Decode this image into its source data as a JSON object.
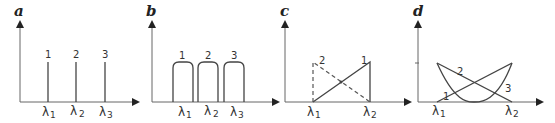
{
  "panels": [
    {
      "label": "a",
      "lines": [
        "1",
        "2",
        "3"
      ],
      "xticks": [
        {
          "sym": "λ",
          "sub": "1"
        },
        {
          "sym": "λ",
          "sub": "2"
        },
        {
          "sym": "λ",
          "sub": "3"
        }
      ]
    },
    {
      "label": "b",
      "lines": [
        "1",
        "2",
        "3"
      ],
      "xticks": [
        {
          "sym": "λ",
          "sub": "1"
        },
        {
          "sym": "λ",
          "sub": "2"
        },
        {
          "sym": "λ",
          "sub": "3"
        }
      ]
    },
    {
      "label": "c",
      "lines": [
        "1",
        "2"
      ],
      "xticks": [
        {
          "sym": "λ",
          "sub": "1"
        },
        {
          "sym": "λ",
          "sub": "2"
        }
      ]
    },
    {
      "label": "d",
      "lines": [
        "1",
        "2",
        "3"
      ],
      "xticks": [
        {
          "sym": "λ",
          "sub": "1"
        },
        {
          "sym": "λ",
          "sub": "2"
        }
      ]
    }
  ],
  "colors": {
    "axis": "#666666",
    "line": "#444444"
  }
}
